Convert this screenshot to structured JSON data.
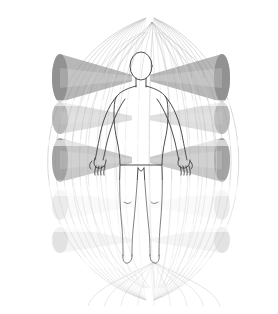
{
  "figure": {
    "background_color": "#ffffff",
    "width": 278,
    "height": 314
  },
  "body_figure": {
    "name": "human-body-outline",
    "view": "anterior",
    "stroke_color": "#3a3a3a",
    "fill": "none",
    "stroke_width": 0.9,
    "center_x": 141,
    "head_top_y": 52,
    "feet_bottom_y": 264,
    "parts": [
      "head",
      "neck",
      "torso",
      "left-arm",
      "right-arm",
      "left-hand",
      "right-hand",
      "left-leg",
      "right-leg",
      "left-foot",
      "right-foot"
    ]
  },
  "focal_points": {
    "top": {
      "label": "superior-focus",
      "x": 152,
      "y": 22
    },
    "bottom": {
      "label": "inferior-focus",
      "x": 154,
      "y": 262
    }
  },
  "envelope": {
    "name": "elliptical-cage",
    "stroke_color": "#c9c9c9",
    "stroke_width": 0.8,
    "arc_count": 11,
    "description": "nested elliptical meridian arcs forming a barrel cage",
    "left_extent_x": 14,
    "right_extent_x": 266,
    "top_y": 18,
    "bottom_y": 300
  },
  "beam_tiers": [
    {
      "tier": 1,
      "label": "beam-tier-1",
      "y": 78,
      "half_height": 24,
      "opacity": 0.62,
      "color": "#8a8a8a",
      "intensity": "high"
    },
    {
      "tier": 2,
      "label": "beam-tier-2",
      "y": 118,
      "half_height": 16,
      "opacity": 0.34,
      "color": "#9d9d9d",
      "intensity": "medium"
    },
    {
      "tier": 3,
      "label": "beam-tier-3",
      "y": 160,
      "half_height": 22,
      "opacity": 0.5,
      "color": "#949494",
      "intensity": "medium-high"
    },
    {
      "tier": 4,
      "label": "beam-tier-4",
      "y": 205,
      "half_height": 15,
      "opacity": 0.1,
      "color": "#b8b8b8",
      "intensity": "low"
    },
    {
      "tier": 5,
      "label": "beam-tier-5",
      "y": 240,
      "half_height": 13,
      "opacity": 0.16,
      "color": "#ababab",
      "intensity": "low"
    }
  ],
  "beam_geometry": {
    "apex_x_left": 132,
    "apex_x_right": 150,
    "left_end_x": 60,
    "right_end_x": 222,
    "cap_radius": 8,
    "description": "horizontal tapered cones converging toward body midline"
  },
  "fan_lines": {
    "name": "converging-fan-lines",
    "stroke_color": "#8f8f8f",
    "stroke_width": 0.5,
    "top_count": 9,
    "bottom_count": 9
  },
  "meridians": {
    "name": "vertical-meridian-lines",
    "stroke_color": "#d2d2d2",
    "stroke_width": 0.7,
    "count": 9
  },
  "chart_data": {
    "type": "scatter",
    "xlabel": "",
    "ylabel": "",
    "categories": [
      "beam-tier-1",
      "beam-tier-2",
      "beam-tier-3",
      "beam-tier-4",
      "beam-tier-5"
    ],
    "series": [
      {
        "name": "beam opacity",
        "values": [
          0.62,
          0.34,
          0.5,
          0.1,
          0.16
        ]
      },
      {
        "name": "tier y position (px)",
        "values": [
          78,
          118,
          160,
          205,
          240
        ]
      },
      {
        "name": "tier half-height (px)",
        "values": [
          24,
          16,
          22,
          15,
          13
        ]
      }
    ]
  }
}
